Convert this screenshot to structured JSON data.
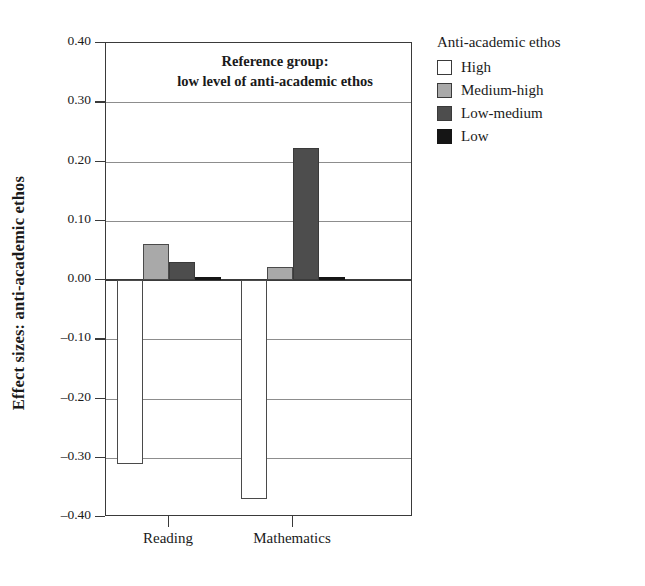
{
  "chart_data": {
    "type": "bar",
    "title": "",
    "xlabel": "",
    "ylabel": "Effect sizes: anti-academic ethos",
    "categories": [
      "Reading",
      "Mathematics"
    ],
    "ylim": [
      -0.4,
      0.4
    ],
    "ytick_values": [
      0.4,
      0.3,
      0.2,
      0.1,
      0.0,
      -0.1,
      -0.2,
      -0.3,
      -0.4
    ],
    "ytick_labels": [
      "0.40",
      "0.30",
      "0.20",
      "0.10",
      "0.00",
      "-0.10",
      "-0.20",
      "-0.30",
      "-0.40"
    ],
    "grid": true,
    "legend_position": "right",
    "annotation": {
      "line1": "Reference group:",
      "line2": "low level of anti-academic ethos"
    },
    "series": [
      {
        "name": "High",
        "key": "high",
        "color": "#ffffff",
        "values": [
          -0.31,
          -0.37
        ]
      },
      {
        "name": "Medium-high",
        "key": "mediumhigh",
        "color": "#a9a9a9",
        "values": [
          0.061,
          0.022
        ]
      },
      {
        "name": "Low-medium",
        "key": "lowmedium",
        "color": "#4d4d4d",
        "values": [
          0.031,
          0.223
        ]
      },
      {
        "name": "Low",
        "key": "low",
        "color": "#151515",
        "values": [
          0.0,
          0.0
        ]
      }
    ]
  },
  "legend": {
    "title": "Anti-academic ethos",
    "items": [
      {
        "label": "High",
        "key": "high"
      },
      {
        "label": "Medium-high",
        "key": "mediumhigh"
      },
      {
        "label": "Low-medium",
        "key": "lowmedium"
      },
      {
        "label": "Low",
        "key": "low"
      }
    ]
  }
}
